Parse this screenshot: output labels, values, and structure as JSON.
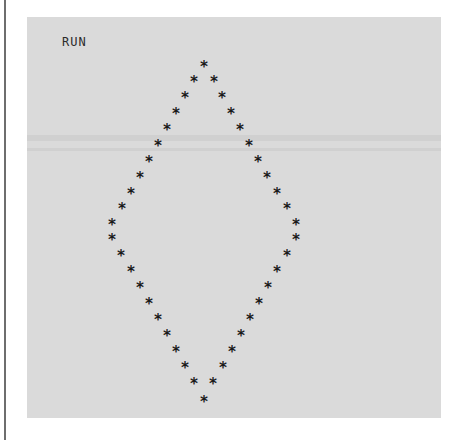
{
  "screen": {
    "prompt": "RUN",
    "glyph": "*",
    "background": "#dadada",
    "text_color": "#1a1a1a"
  },
  "pattern": {
    "shape": "diamond",
    "points": [
      [
        204,
        67
      ],
      [
        194,
        82
      ],
      [
        214,
        82
      ],
      [
        185,
        98
      ],
      [
        222,
        98
      ],
      [
        176,
        114
      ],
      [
        231,
        114
      ],
      [
        167,
        130
      ],
      [
        240,
        130
      ],
      [
        158,
        146
      ],
      [
        249,
        146
      ],
      [
        149,
        162
      ],
      [
        258,
        162
      ],
      [
        140,
        178
      ],
      [
        267,
        178
      ],
      [
        131,
        194
      ],
      [
        277,
        194
      ],
      [
        122,
        209
      ],
      [
        287,
        209
      ],
      [
        112,
        225
      ],
      [
        296,
        225
      ],
      [
        112,
        240
      ],
      [
        296,
        240
      ],
      [
        121,
        256
      ],
      [
        287,
        256
      ],
      [
        131,
        272
      ],
      [
        277,
        272
      ],
      [
        140,
        288
      ],
      [
        268,
        288
      ],
      [
        149,
        304
      ],
      [
        259,
        304
      ],
      [
        158,
        320
      ],
      [
        250,
        320
      ],
      [
        167,
        336
      ],
      [
        241,
        336
      ],
      [
        176,
        352
      ],
      [
        232,
        352
      ],
      [
        185,
        368
      ],
      [
        223,
        368
      ],
      [
        194,
        384
      ],
      [
        213,
        384
      ],
      [
        204,
        402
      ]
    ]
  }
}
